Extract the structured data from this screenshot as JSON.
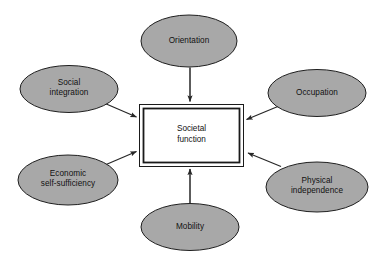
{
  "diagram": {
    "type": "hub-and-spoke concept diagram",
    "center": {
      "label": "Societal\nfunction",
      "shape": "double-bordered rectangle",
      "fill": "#ffffff",
      "border_color": "#1a1a1a"
    },
    "style": {
      "ellipse_fill": "#a8a8a8",
      "ellipse_stroke": "#1f1f1f",
      "arrow_color": "#262626",
      "background": "#ffffff"
    },
    "nodes": [
      {
        "id": "orientation",
        "label": "Orientation",
        "position": "top",
        "cx": 189,
        "cy": 41,
        "rx": 48,
        "ry": 26
      },
      {
        "id": "social-integration",
        "label": "Social\nintegration",
        "position": "top-left",
        "cx": 69,
        "cy": 89,
        "rx": 49,
        "ry": 23.5
      },
      {
        "id": "occupation",
        "label": "Occupation",
        "position": "top-right",
        "cx": 317,
        "cy": 93,
        "rx": 49,
        "ry": 23.5
      },
      {
        "id": "economic-self-sufficiency",
        "label": "Economic\nself-sufficiency",
        "position": "bottom-left",
        "cx": 68,
        "cy": 180,
        "rx": 50,
        "ry": 25
      },
      {
        "id": "physical-independence",
        "label": "Physical\nindependence",
        "position": "bottom-right",
        "cx": 317,
        "cy": 187,
        "rx": 51,
        "ry": 25
      },
      {
        "id": "mobility",
        "label": "Mobility",
        "position": "bottom",
        "cx": 190,
        "cy": 227,
        "rx": 49,
        "ry": 23.5
      }
    ],
    "arrows": [
      {
        "from": "orientation",
        "to": "center",
        "direction": "down"
      },
      {
        "from": "social-integration",
        "to": "center",
        "direction": "down-right"
      },
      {
        "from": "occupation",
        "to": "center",
        "direction": "down-left"
      },
      {
        "from": "economic-self-sufficiency",
        "to": "center",
        "direction": "up-right"
      },
      {
        "from": "physical-independence",
        "to": "center",
        "direction": "up-left"
      },
      {
        "from": "mobility",
        "to": "center",
        "direction": "up"
      }
    ]
  }
}
